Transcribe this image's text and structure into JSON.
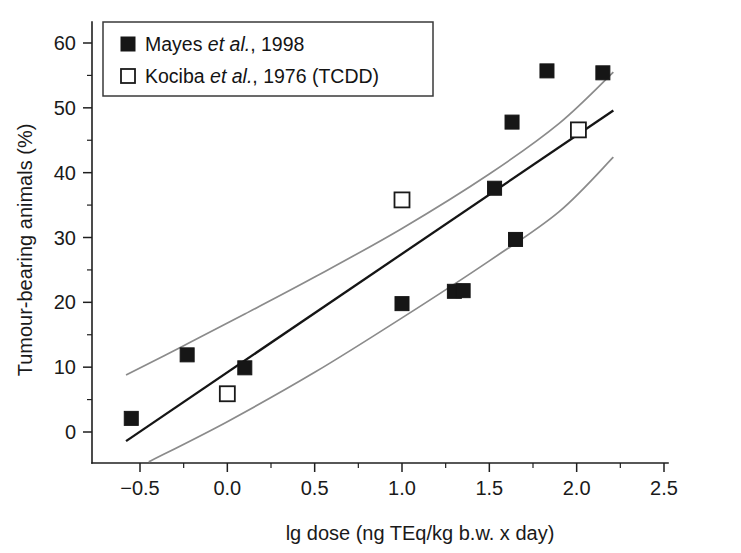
{
  "chart_data": {
    "type": "scatter",
    "title": "",
    "xlabel": "lg dose (ng TEq/kg b.w. x day)",
    "ylabel": "Tumour-bearing animals (%)",
    "xlim": [
      -0.75,
      2.5
    ],
    "ylim": [
      -5,
      65
    ],
    "grid": false,
    "xticks": [
      -0.5,
      0.0,
      0.5,
      1.0,
      1.5,
      2.0,
      2.5
    ],
    "xtick_labels": [
      "-0.5",
      "0.0",
      "0.5",
      "1.0",
      "1.5",
      "2.0",
      "2.5"
    ],
    "xminor_ticks": [
      -0.25,
      0.25,
      0.75,
      1.25,
      1.75,
      2.25
    ],
    "yticks": [
      0,
      10,
      20,
      30,
      40,
      50,
      60
    ],
    "ytick_labels": [
      "0",
      "10",
      "20",
      "30",
      "40",
      "50",
      "60"
    ],
    "yminor_ticks": [
      5,
      15,
      25,
      35,
      45,
      55,
      65
    ],
    "legend_position": "top-left",
    "series": [
      {
        "name": "Mayes et al., 1998",
        "marker": "filled-square",
        "color": "#161616",
        "points": [
          {
            "x": -0.55,
            "y": 2.1
          },
          {
            "x": -0.23,
            "y": 11.9
          },
          {
            "x": 0.1,
            "y": 9.9
          },
          {
            "x": 1.0,
            "y": 19.8
          },
          {
            "x": 1.3,
            "y": 21.7
          },
          {
            "x": 1.35,
            "y": 21.8
          },
          {
            "x": 1.53,
            "y": 37.6
          },
          {
            "x": 1.63,
            "y": 47.8
          },
          {
            "x": 1.65,
            "y": 29.7
          },
          {
            "x": 1.83,
            "y": 55.7
          },
          {
            "x": 2.15,
            "y": 55.4
          }
        ]
      },
      {
        "name": "Kociba et al., 1976 (TCDD)",
        "marker": "open-square",
        "color": "#ffffff",
        "points": [
          {
            "x": 0.0,
            "y": 5.9
          },
          {
            "x": 1.0,
            "y": 35.8
          },
          {
            "x": 2.01,
            "y": 46.6
          }
        ]
      }
    ],
    "fit_line": {
      "name": "regression-line",
      "x_start": -0.58,
      "x_end": 2.21,
      "y_start": -1.4,
      "y_end": 49.6
    },
    "confidence_bands": {
      "upper": {
        "name": "upper-confidence-band",
        "points": [
          {
            "x": -0.58,
            "y": 8.8
          },
          {
            "x": -0.25,
            "y": 13.3
          },
          {
            "x": 0.1,
            "y": 18.2
          },
          {
            "x": 0.5,
            "y": 23.9
          },
          {
            "x": 1.0,
            "y": 31.4
          },
          {
            "x": 1.5,
            "y": 39.8
          },
          {
            "x": 1.9,
            "y": 47.6
          },
          {
            "x": 2.21,
            "y": 55.5
          }
        ]
      },
      "lower": {
        "name": "lower-confidence-band",
        "points": [
          {
            "x": -0.45,
            "y": -4.6
          },
          {
            "x": 0.0,
            "y": 1.6
          },
          {
            "x": 0.5,
            "y": 9.2
          },
          {
            "x": 1.0,
            "y": 17.6
          },
          {
            "x": 1.5,
            "y": 26.4
          },
          {
            "x": 1.9,
            "y": 34.0
          },
          {
            "x": 2.21,
            "y": 42.4
          }
        ]
      }
    },
    "legend": {
      "entries": [
        {
          "marker": "filled-square",
          "label_plain": "Mayes ",
          "label_italic": "et al.",
          "label_tail": ", 1998"
        },
        {
          "marker": "open-square",
          "label_plain": "Kociba ",
          "label_italic": "et al.",
          "label_tail": ", 1976 (TCDD)"
        }
      ]
    }
  },
  "colors": {
    "axis": "#1f1f1f",
    "fit_line": "#151515",
    "confidence_band": "#8b8b8b",
    "marker_filled": "#161616",
    "marker_open_stroke": "#1a1a1a",
    "background": "#ffffff"
  }
}
